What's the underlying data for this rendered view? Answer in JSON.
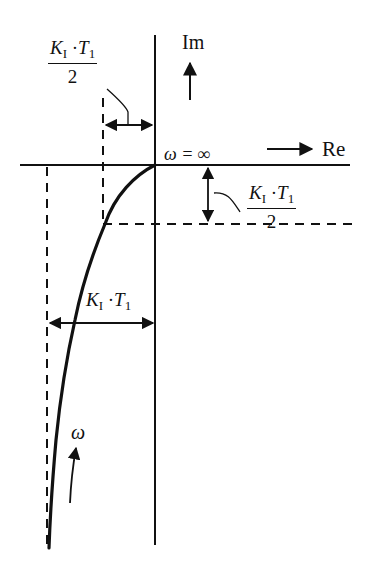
{
  "diagram": {
    "type": "nyquist-plot",
    "axes": {
      "imag_label": "Im",
      "real_label": "Re"
    },
    "origin_label": "ω = ∞",
    "freq_label": "ω",
    "dimension_labels": {
      "top_half": {
        "numerator_K": "K",
        "numerator_K_sub": "I",
        "numerator_dot": "·",
        "numerator_T": "T",
        "numerator_T_sub": "1",
        "denominator": "2"
      },
      "right_half": {
        "numerator_K": "K",
        "numerator_K_sub": "I",
        "numerator_dot": "·",
        "numerator_T": "T",
        "numerator_T_sub": "1",
        "denominator": "2"
      },
      "full": {
        "K": "K",
        "K_sub": "I",
        "dot": "·",
        "T": "T",
        "T_sub": "1"
      }
    },
    "colors": {
      "stroke": "#111111",
      "background": "#ffffff"
    }
  }
}
